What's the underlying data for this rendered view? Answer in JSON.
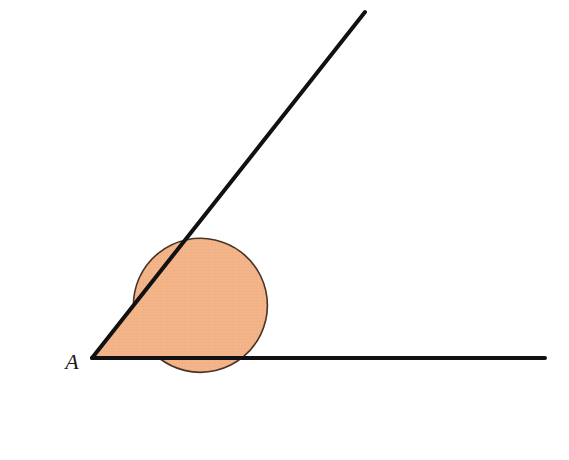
{
  "figure": {
    "type": "geometry-angle-diagram",
    "background_color": "#ffffff",
    "canvas": {
      "width": 569,
      "height": 460
    }
  },
  "labels": {
    "vertex": "A",
    "vertex_label_x": 72,
    "vertex_label_y": 369,
    "vertex_label_size": 22
  },
  "geometry": {
    "vertex": {
      "x": 92,
      "y": 358
    },
    "rays": [
      {
        "name": "horizontal-ray",
        "from": {
          "x": 92,
          "y": 358
        },
        "to": {
          "x": 545,
          "y": 358
        },
        "angle_degrees": 0
      },
      {
        "name": "upper-ray",
        "from": {
          "x": 92,
          "y": 358
        },
        "to": {
          "x": 365,
          "y": 12
        },
        "angle_degrees": 51.7
      }
    ],
    "sector": {
      "name": "reflex-angle-sector",
      "center": {
        "x": 92,
        "y": 358
      },
      "radius": 67,
      "start_angle_degrees": 51.7,
      "sweep_degrees": 308.3,
      "is_reflex": true,
      "path": "M 92 358 L 133.4 305.4 A 67 67 0 1 1 159 358 Z"
    },
    "circle_outline": {
      "center": {
        "x": 92,
        "y": 358
      },
      "radius": 67
    }
  },
  "colors": {
    "sector_fill": "#f2b387",
    "sector_stroke": "#4a3328",
    "ray_stroke": "#111111",
    "label_color": "#1a1a1a",
    "background": "#ffffff"
  },
  "strokes": {
    "ray_width": 4,
    "sector_outline_width": 1.6
  },
  "chart_data": {
    "type": "diagram",
    "vertex_label": "A",
    "ray_angles_degrees": [
      0,
      51.7
    ],
    "shaded_angle_degrees": 308.3,
    "unshaded_angle_degrees": 51.7
  }
}
